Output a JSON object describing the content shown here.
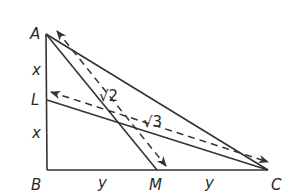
{
  "diagram": {
    "points": {
      "A": {
        "label": "A",
        "x": 46,
        "y": 34
      },
      "L": {
        "label": "L",
        "x": 47,
        "y": 100
      },
      "B": {
        "label": "B",
        "x": 47,
        "y": 170
      },
      "M": {
        "label": "M",
        "x": 157,
        "y": 170
      },
      "C": {
        "label": "C",
        "x": 268,
        "y": 170
      }
    },
    "segment_labels": {
      "AL": "x",
      "LB": "x",
      "BM": "y",
      "MC": "y"
    },
    "measures": {
      "AM_dashed": "√2",
      "LC_dashed": "√3"
    },
    "colors": {
      "stroke": "#333333",
      "text": "#2a2a2a",
      "background": "#ffffff"
    }
  }
}
